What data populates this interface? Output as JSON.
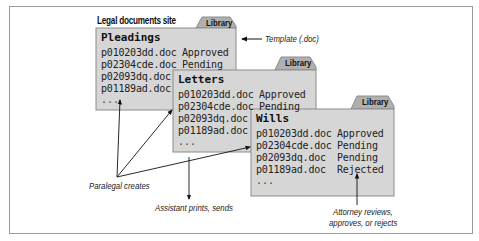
{
  "diagram": {
    "site_title": "Legal documents site",
    "libraries": [
      {
        "name": "Pleadings",
        "tab_label": "Library",
        "documents": [
          {
            "file": "p010203dd.doc",
            "status": "Approved"
          },
          {
            "file": "p02304cde.doc",
            "status": "Pending"
          },
          {
            "file": "p02093dq.doc",
            "status": ""
          },
          {
            "file": "p01189ad.doc",
            "status": ""
          }
        ],
        "more": "..."
      },
      {
        "name": "Letters",
        "tab_label": "Library",
        "documents": [
          {
            "file": "p010203dd.doc",
            "status": "Approved"
          },
          {
            "file": "p02304cde.doc",
            "status": "Pending"
          },
          {
            "file": "p02093dq.doc",
            "status": ""
          },
          {
            "file": "p01189ad.doc",
            "status": ""
          }
        ],
        "more": "..."
      },
      {
        "name": "Wills",
        "tab_label": "Library",
        "documents": [
          {
            "file": "p010203dd.doc",
            "status": "Approved"
          },
          {
            "file": "p02304cde.doc",
            "status": "Pending"
          },
          {
            "file": "p02093dq.doc",
            "status": "Pending"
          },
          {
            "file": "p01189ad.doc",
            "status": "Rejected"
          }
        ],
        "more": "..."
      }
    ],
    "annotations": {
      "template": "Template (.doc)",
      "paralegal": "Paralegal creates",
      "assistant": "Assistant prints, sends",
      "attorney_line1": "Attorney reviews,",
      "attorney_line2": "approves, or rejects"
    },
    "colors": {
      "box_fill": "#d6d6d6",
      "tab_fill": "#b0b0b0",
      "border": "#8c8c8c",
      "arrow": "#111111"
    }
  }
}
